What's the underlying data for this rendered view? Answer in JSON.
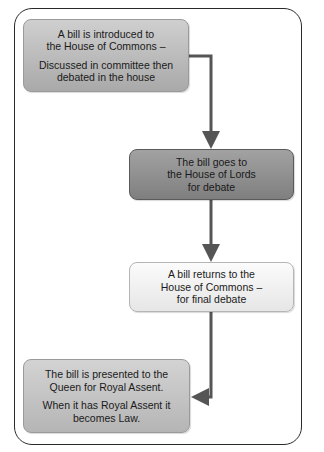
{
  "diagram": {
    "type": "flowchart",
    "title": "",
    "steps": [
      {
        "id": "introduced",
        "lines": [
          "A bill is introduced to",
          "the House of Commons –"
        ],
        "lines2": [
          "Discussed in committee then",
          "debated in the house"
        ]
      },
      {
        "id": "lords",
        "lines": [
          "The bill goes to",
          "the House of Lords",
          "for debate"
        ]
      },
      {
        "id": "returns",
        "lines": [
          "A bill returns to the",
          "House of Commons –",
          "for final debate"
        ]
      },
      {
        "id": "royal-assent",
        "lines": [
          "The bill is presented to the",
          "Queen for Royal Assent."
        ],
        "lines2": [
          "When it has Royal Assent it",
          "becomes Law."
        ]
      }
    ],
    "connectors": [
      {
        "from": "introduced",
        "to": "lords",
        "direction": "right-then-down"
      },
      {
        "from": "lords",
        "to": "returns",
        "direction": "down"
      },
      {
        "from": "returns",
        "to": "royal-assent",
        "direction": "down-then-left"
      }
    ],
    "colors": {
      "frame": "#2a2a2a",
      "arrow": "#555555",
      "step1_fill": "#bcbcbc",
      "step2_fill": "#909090",
      "step3_fill": "#f0f0f0",
      "step4_fill": "#c4c4c4"
    }
  }
}
